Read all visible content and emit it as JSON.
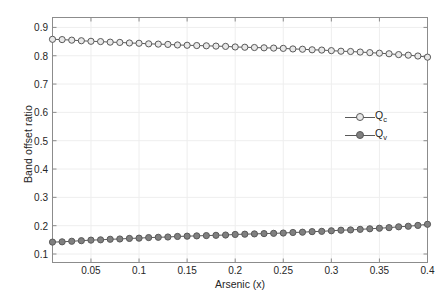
{
  "chart_data": {
    "type": "line",
    "title": "",
    "xlabel": "Arsenic (x)",
    "ylabel": "Band offset ratio",
    "xlim": [
      0.01,
      0.4
    ],
    "ylim": [
      0.07,
      0.935
    ],
    "grid": true,
    "legend_position": "center-right",
    "xticks": [
      0.05,
      0.1,
      0.15,
      0.2,
      0.25,
      0.3,
      0.35,
      0.4
    ],
    "xticklabels": [
      "0.05",
      "0.1",
      "0.15",
      "0.2",
      "0.25",
      "0.3",
      "0.35",
      "0.4"
    ],
    "yticks": [
      0.1,
      0.2,
      0.3,
      0.4,
      0.5,
      0.6,
      0.7,
      0.8,
      0.9
    ],
    "yticklabels": [
      "0.1",
      "0.2",
      "0.3",
      "0.4",
      "0.5",
      "0.6",
      "0.7",
      "0.8",
      "0.9"
    ],
    "x": [
      0.01,
      0.02,
      0.03,
      0.04,
      0.05,
      0.06,
      0.07,
      0.08,
      0.09,
      0.1,
      0.11,
      0.12,
      0.13,
      0.14,
      0.15,
      0.16,
      0.17,
      0.18,
      0.19,
      0.2,
      0.21,
      0.22,
      0.23,
      0.24,
      0.25,
      0.26,
      0.27,
      0.28,
      0.29,
      0.3,
      0.31,
      0.32,
      0.33,
      0.34,
      0.35,
      0.36,
      0.37,
      0.38,
      0.39,
      0.4
    ],
    "series": [
      {
        "name": "Q_c",
        "label": "Q",
        "sublabel": "c",
        "marker": "open-circle",
        "color": "#595959",
        "marker_face": "#e8e8e8",
        "values": [
          0.858,
          0.857,
          0.855,
          0.853,
          0.851,
          0.85,
          0.848,
          0.847,
          0.845,
          0.844,
          0.842,
          0.841,
          0.84,
          0.838,
          0.837,
          0.836,
          0.835,
          0.834,
          0.833,
          0.831,
          0.83,
          0.829,
          0.828,
          0.827,
          0.826,
          0.824,
          0.823,
          0.821,
          0.82,
          0.818,
          0.816,
          0.815,
          0.813,
          0.811,
          0.809,
          0.807,
          0.804,
          0.802,
          0.799,
          0.795
        ]
      },
      {
        "name": "Q_v",
        "label": "Q",
        "sublabel": "v",
        "marker": "filled-circle",
        "color": "#595959",
        "marker_face": "#808080",
        "values": [
          0.142,
          0.143,
          0.145,
          0.147,
          0.149,
          0.15,
          0.152,
          0.153,
          0.155,
          0.156,
          0.158,
          0.159,
          0.16,
          0.162,
          0.163,
          0.164,
          0.165,
          0.166,
          0.167,
          0.169,
          0.17,
          0.171,
          0.172,
          0.173,
          0.174,
          0.176,
          0.177,
          0.179,
          0.18,
          0.182,
          0.184,
          0.185,
          0.187,
          0.189,
          0.191,
          0.193,
          0.196,
          0.198,
          0.201,
          0.205
        ]
      }
    ]
  },
  "axes": {
    "frame_color": "#8c8c8c",
    "grid_color": "#eeeeee",
    "background": "#ffffff"
  }
}
